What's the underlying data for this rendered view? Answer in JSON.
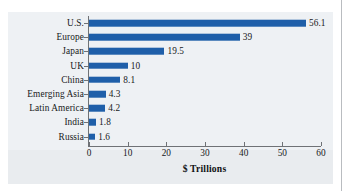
{
  "chart_data": {
    "type": "bar",
    "orientation": "horizontal",
    "title": "",
    "subtitle": "",
    "xlabel": "$ Trillions",
    "ylabel": "",
    "categories": [
      "U.S.",
      "Europe",
      "Japan",
      "UK",
      "China",
      "Emerging Asia",
      "Latin America",
      "India",
      "Russia"
    ],
    "values": [
      56.1,
      39,
      19.5,
      10,
      8.1,
      4.3,
      4.2,
      1.8,
      1.6
    ],
    "value_labels": [
      "56.1",
      "39",
      "19.5",
      "10",
      "8.1",
      "4.3",
      "4.2",
      "1.8",
      "1.6"
    ],
    "xlim": [
      0,
      60
    ],
    "xticks": [
      0,
      10,
      20,
      30,
      40,
      50,
      60
    ],
    "xtick_labels": [
      "0",
      "10",
      "20",
      "30",
      "40",
      "50",
      "60"
    ],
    "grid": false,
    "legend": null,
    "bar_color": "#1f5fa9",
    "text_color": "#17181a",
    "axis_color": "#6f7276",
    "plot_background": "#eef1f4",
    "page_background": "#ffffff"
  }
}
